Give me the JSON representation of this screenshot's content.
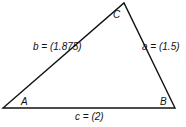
{
  "diagram": {
    "type": "triangle",
    "stroke_color": "#111111",
    "vertices": [
      {
        "name": "A",
        "label": "A",
        "x": 3,
        "y": 108
      },
      {
        "name": "B",
        "label": "B",
        "x": 175,
        "y": 108
      },
      {
        "name": "C",
        "label": "C",
        "x": 124,
        "y": 3
      }
    ],
    "sides": [
      {
        "name": "a",
        "label": "a = (1.5)",
        "between": [
          "B",
          "C"
        ],
        "length": 1.5
      },
      {
        "name": "b",
        "label": "b = (1.875)",
        "between": [
          "A",
          "C"
        ],
        "length": 1.875
      },
      {
        "name": "c",
        "label": "c = (2)",
        "between": [
          "A",
          "B"
        ],
        "length": 2
      }
    ]
  }
}
